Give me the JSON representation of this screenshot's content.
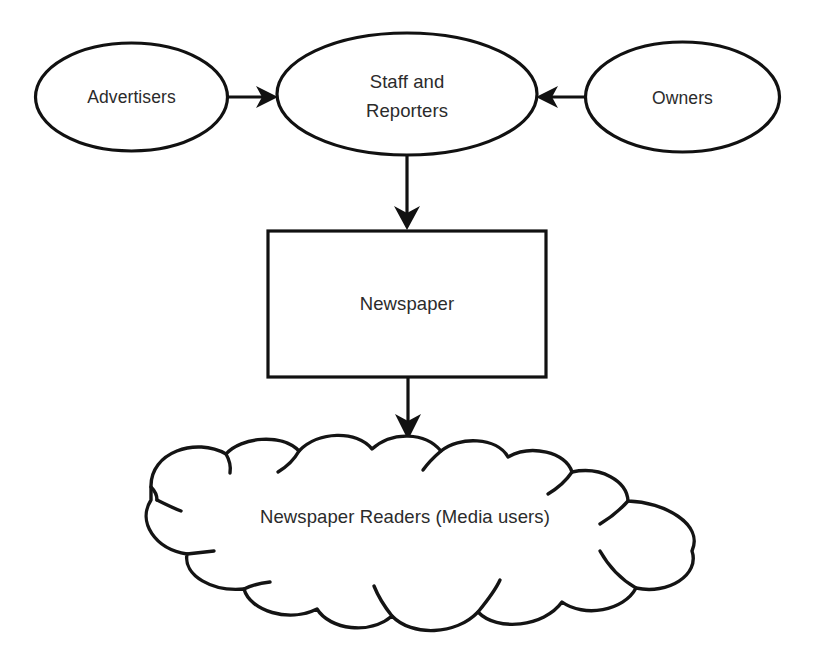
{
  "diagram": {
    "type": "flowchart",
    "background_color": "#ffffff",
    "line_color": "#111111",
    "text_color": "#2b2b2b",
    "nodes": [
      {
        "id": "advertisers",
        "shape": "ellipse",
        "label": "Advertisers"
      },
      {
        "id": "staff_reporters",
        "shape": "ellipse",
        "label_line1": "Staff and",
        "label_line2": "Reporters"
      },
      {
        "id": "owners",
        "shape": "ellipse",
        "label": "Owners"
      },
      {
        "id": "newspaper",
        "shape": "rectangle",
        "label": "Newspaper"
      },
      {
        "id": "readers",
        "shape": "cloud",
        "label": "Newspaper Readers (Media users)"
      }
    ],
    "edges": [
      {
        "id": "edge-advertisers-staff",
        "from": "advertisers",
        "to": "staff_reporters",
        "direction": "right"
      },
      {
        "id": "edge-owners-staff",
        "from": "owners",
        "to": "staff_reporters",
        "direction": "left"
      },
      {
        "id": "edge-staff-newspaper",
        "from": "staff_reporters",
        "to": "newspaper",
        "direction": "down"
      },
      {
        "id": "edge-newspaper-readers",
        "from": "newspaper",
        "to": "readers",
        "direction": "down"
      }
    ]
  }
}
